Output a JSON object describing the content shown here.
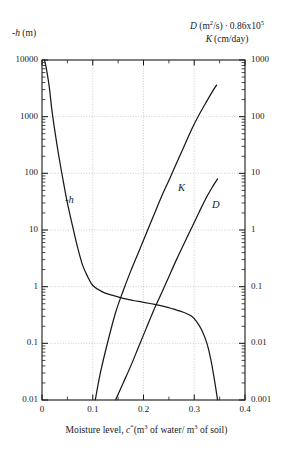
{
  "figure": {
    "left_axis_header": {
      "symbol": "-h",
      "unit": "(m)"
    },
    "right_axis_header_line1": {
      "symbol": "D",
      "unit": "(m2/s)",
      "sep": "·",
      "factor_mantissa": "0.86x10",
      "factor_exp": "5"
    },
    "right_axis_header_line2": {
      "symbol": "K",
      "unit": "(cm/day)"
    },
    "x_caption": {
      "text_before": "Moisture level, ",
      "symbol": "c",
      "star": "*",
      "unit_a": "(m",
      "unit_a_exp": "3",
      "unit_mid": " of water/ m",
      "unit_b_exp": "3",
      "unit_tail": " of soil)"
    },
    "curve_labels": [
      {
        "name": "suction-head-curve-label",
        "text": "-h"
      },
      {
        "name": "hydraulic-conductivity-curve-label",
        "text": "K"
      },
      {
        "name": "diffusivity-curve-label",
        "text": "D"
      }
    ]
  },
  "chart_data": {
    "type": "line",
    "title": "",
    "subtitle": "",
    "xlabel": "Moisture level, c* (m3 of water/ m3 of soil)",
    "ylabel_left": "-h (m)",
    "ylabel_right": "D (m2/s) · 0.86x10^5 ; K (cm/day)",
    "grid": true,
    "legend_position": "inline-curve-labels",
    "x_scale": "linear",
    "xlim": [
      0,
      0.4
    ],
    "x_ticks": [
      0,
      0.1,
      0.2,
      0.3,
      0.4
    ],
    "x_tick_labels": [
      "0",
      "0.1",
      "0.2",
      "0.3",
      "0.4"
    ],
    "x_minor_ticks": [
      0.05,
      0.15,
      0.25,
      0.35
    ],
    "y_left_scale": "log",
    "y_left_lim": [
      0.01,
      10000
    ],
    "y_left_ticks": [
      10000,
      1000,
      100,
      10,
      1,
      0.1,
      0.01
    ],
    "y_left_tick_labels": [
      "10000",
      "1000",
      "100",
      "10",
      "1",
      "0.1",
      "0.01"
    ],
    "y_right_scale": "log",
    "y_right_lim": [
      0.001,
      1000
    ],
    "y_right_ticks": [
      1000,
      100,
      10,
      1,
      0.1,
      0.01,
      0.001
    ],
    "y_right_tick_labels": [
      "1000",
      "100",
      "10",
      "1",
      "0.1",
      "0.01",
      "0.001"
    ],
    "gridlines_y_left": [
      1000,
      100,
      10,
      1,
      0.1,
      0.01
    ],
    "gridlines_x": [
      0.1,
      0.2,
      0.3
    ],
    "series": [
      {
        "name": "-h",
        "label": "-h",
        "axis": "left",
        "units": "m",
        "points": [
          [
            0.005,
            10000
          ],
          [
            0.01,
            6000
          ],
          [
            0.015,
            3000
          ],
          [
            0.02,
            1200
          ],
          [
            0.03,
            300
          ],
          [
            0.04,
            90
          ],
          [
            0.05,
            30
          ],
          [
            0.06,
            12
          ],
          [
            0.07,
            5.0
          ],
          [
            0.08,
            2.4
          ],
          [
            0.09,
            1.5
          ],
          [
            0.1,
            1.05
          ],
          [
            0.12,
            0.8
          ],
          [
            0.14,
            0.7
          ],
          [
            0.16,
            0.62
          ],
          [
            0.18,
            0.57
          ],
          [
            0.2,
            0.53
          ],
          [
            0.22,
            0.49
          ],
          [
            0.24,
            0.45
          ],
          [
            0.26,
            0.4
          ],
          [
            0.28,
            0.35
          ],
          [
            0.295,
            0.3
          ],
          [
            0.305,
            0.24
          ],
          [
            0.315,
            0.17
          ],
          [
            0.325,
            0.1
          ],
          [
            0.333,
            0.05
          ],
          [
            0.34,
            0.022
          ],
          [
            0.346,
            0.01
          ]
        ]
      },
      {
        "name": "K",
        "label": "K",
        "axis": "right",
        "units": "cm/day",
        "points": [
          [
            0.105,
            0.001
          ],
          [
            0.115,
            0.003
          ],
          [
            0.13,
            0.011
          ],
          [
            0.145,
            0.035
          ],
          [
            0.16,
            0.085
          ],
          [
            0.175,
            0.19
          ],
          [
            0.19,
            0.4
          ],
          [
            0.205,
            0.85
          ],
          [
            0.22,
            1.8
          ],
          [
            0.235,
            3.8
          ],
          [
            0.25,
            7.5
          ],
          [
            0.265,
            15
          ],
          [
            0.28,
            30
          ],
          [
            0.295,
            60
          ],
          [
            0.31,
            110
          ],
          [
            0.325,
            190
          ],
          [
            0.336,
            280
          ],
          [
            0.344,
            360
          ]
        ]
      },
      {
        "name": "D",
        "label": "D",
        "axis": "right",
        "units": "m2/s x 0.86e5",
        "points": [
          [
            0.145,
            0.001
          ],
          [
            0.16,
            0.002
          ],
          [
            0.175,
            0.004
          ],
          [
            0.19,
            0.0085
          ],
          [
            0.205,
            0.018
          ],
          [
            0.22,
            0.038
          ],
          [
            0.235,
            0.075
          ],
          [
            0.25,
            0.15
          ],
          [
            0.265,
            0.3
          ],
          [
            0.28,
            0.58
          ],
          [
            0.295,
            1.1
          ],
          [
            0.31,
            2.1
          ],
          [
            0.325,
            3.9
          ],
          [
            0.338,
            6.2
          ],
          [
            0.346,
            8.0
          ]
        ]
      }
    ]
  },
  "style": {
    "axis_color": "#1a1a1a",
    "curve_color": "#1a1a1a",
    "grid_color": "#b9b9b9",
    "background": "#ffffff"
  }
}
